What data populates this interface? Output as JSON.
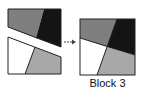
{
  "figure": {
    "label": "Block 3",
    "arrow": "right-arrow",
    "colors": {
      "black": "#111111",
      "gray": "#8a8a8a",
      "light_gray": "#a6a6a6",
      "white": "#ffffff",
      "outline": "#222222"
    }
  }
}
